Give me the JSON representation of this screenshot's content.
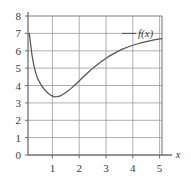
{
  "chart_data": {
    "type": "line",
    "title": "",
    "subtitle": "",
    "xlabel": "x",
    "ylabel": "",
    "xlim": [
      0,
      5.5
    ],
    "ylim": [
      0,
      8
    ],
    "grid": true,
    "legend_position": "inline-annotation",
    "x_ticks": [
      1,
      2,
      3,
      4,
      5
    ],
    "x_tick_labels": [
      "1",
      "2",
      "3",
      "4",
      "5"
    ],
    "y_ticks": [
      0,
      1,
      2,
      3,
      4,
      5,
      6,
      7,
      8
    ],
    "y_tick_labels": [
      "0",
      "1",
      "2",
      "3",
      "4",
      "5",
      "6",
      "7",
      "8"
    ],
    "annotations": [
      {
        "name": "curve-label",
        "text": "f(x)",
        "x": 4.3,
        "y": 7.0,
        "leader_line": true
      }
    ],
    "series": [
      {
        "name": "f(x)",
        "color": "#555555",
        "x": [
          0.05,
          0.1,
          0.15,
          0.2,
          0.25,
          0.3,
          0.35,
          0.4,
          0.5,
          0.6,
          0.7,
          0.8,
          0.9,
          1.0,
          1.1,
          1.2,
          1.4,
          1.6,
          1.8,
          2.0,
          2.25,
          2.5,
          2.75,
          3.0,
          3.25,
          3.5,
          3.75,
          4.0,
          4.25,
          4.5,
          4.75,
          5.0
        ],
        "values": [
          7.0,
          6.35,
          5.75,
          5.3,
          4.95,
          4.67,
          4.45,
          4.28,
          4.0,
          3.8,
          3.62,
          3.5,
          3.4,
          3.35,
          3.36,
          3.4,
          3.58,
          3.82,
          4.1,
          4.4,
          4.76,
          5.1,
          5.4,
          5.66,
          5.88,
          6.08,
          6.23,
          6.36,
          6.47,
          6.56,
          6.64,
          6.7
        ]
      }
    ],
    "axis_colors": {
      "frame": "#7d7d7d",
      "gridline": "#9a9a9a",
      "curve": "#555555",
      "text": "#3b3b3b",
      "background": "#ffffff"
    }
  }
}
